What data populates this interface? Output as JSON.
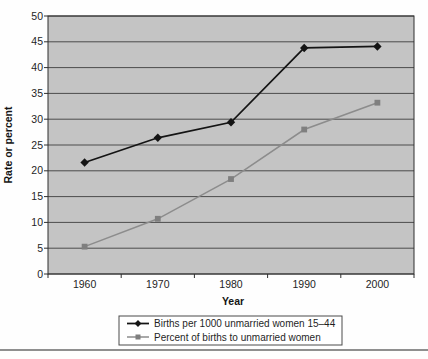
{
  "figure": {
    "bottom_rule_color": "#8f8f8f"
  },
  "chart_data": {
    "type": "line",
    "categories": [
      "1960",
      "1970",
      "1980",
      "1990",
      "2000"
    ],
    "series": [
      {
        "name": "Births per 1000 unmarried women 15–44",
        "values": [
          21.6,
          26.4,
          29.4,
          43.8,
          44.1
        ],
        "color": "#141414",
        "marker": "diamond"
      },
      {
        "name": "Percent of births to unmarried women",
        "values": [
          5.3,
          10.7,
          18.4,
          28.0,
          33.2
        ],
        "color": "#8c8c8c",
        "marker": "square",
        "marker_color": "#7f7f7f"
      }
    ],
    "title": "",
    "xlabel": "Year",
    "ylabel": "Rate or percent",
    "ylim": [
      0,
      50
    ],
    "ytick_step": 5,
    "yticks": [
      "0",
      "5",
      "10",
      "15",
      "20",
      "25",
      "30",
      "35",
      "40",
      "45",
      "50"
    ],
    "grid": true,
    "gridline_color": "#4c4c4c",
    "plot_bg": "#c4c4c4",
    "plot_border_color": "#2f2f2f",
    "legend_position": "bottom"
  }
}
